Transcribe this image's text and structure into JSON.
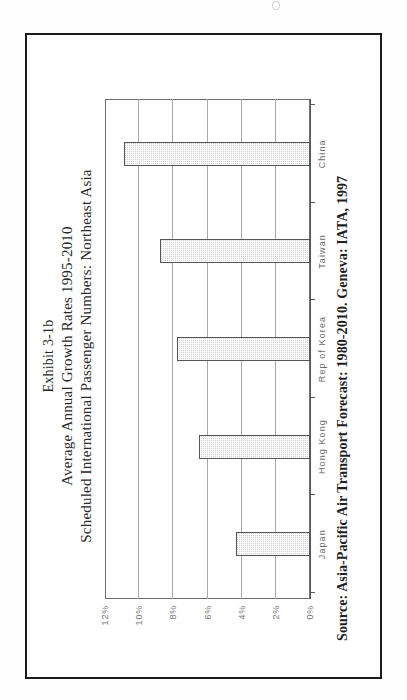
{
  "document": {
    "page_background": "#fefefe",
    "frame_color": "#1a1a1a"
  },
  "exhibit": {
    "title_line_1": "Exhibit 3-1b",
    "title_line_2": "Average Annual Growth Rates 1995-2010",
    "title_line_3": "Scheduled International Passenger Numbers: Northeast Asia",
    "source": "Source: Asia-Pacific Air Transport Forecast: 1980-2010. Geneva: IATA, 1997"
  },
  "chart_data": {
    "type": "bar",
    "categories": [
      "Japan",
      "Hong Kong",
      "Rep of Korea",
      "Taiwan",
      "China"
    ],
    "values": [
      4.35,
      6.5,
      7.8,
      8.8,
      10.9
    ],
    "value_unit": "%",
    "xlabel": "",
    "ylabel": "",
    "ylim": [
      0,
      12
    ],
    "ytick_labels": [
      "0%",
      "2%",
      "4%",
      "6%",
      "8%",
      "10%",
      "12%"
    ],
    "ytick_values": [
      0,
      2,
      4,
      6,
      8,
      10,
      12
    ],
    "grid": true,
    "gridlines_at": [
      2,
      4,
      6,
      8,
      10
    ],
    "legend": null,
    "orientation": "vertical-bars-rotated-90ccw-on-page",
    "bar_fill": "#d2d2d2",
    "bar_border": "#555555"
  }
}
